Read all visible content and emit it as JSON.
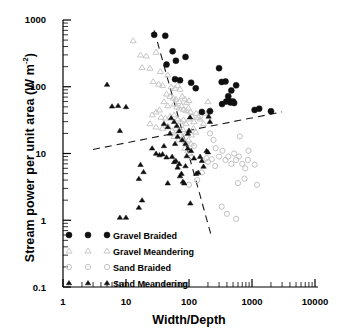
{
  "chart_data": {
    "type": "scatter",
    "title": "",
    "xlabel": "Width/Depth",
    "ylabel_text": "Stream power per unit area (W m",
    "ylabel_sup": "-2",
    "ylabel_tail": ")",
    "ylabel_full": "Stream power per unit area (W m-2)",
    "xscale": "log",
    "yscale": "log",
    "xlim": [
      1,
      10000
    ],
    "ylim": [
      0.1,
      1000
    ],
    "grid": false,
    "legend_position": "bottom-left-inside",
    "xticks": [
      "1",
      "10",
      "100",
      "1000",
      "10000"
    ],
    "xtick_values": [
      1,
      10,
      100,
      1000,
      10000
    ],
    "yticks": [
      "1000",
      "100",
      "10",
      "1",
      "0.1"
    ],
    "ytick_values": [
      1000,
      100,
      10,
      1,
      0.1
    ],
    "legend": [
      {
        "label": "Gravel Braided",
        "marker": "filled-circle",
        "color": "#101010"
      },
      {
        "label": "Gravel Meandering",
        "marker": "open-triangle",
        "color": "#c8c8c8"
      },
      {
        "label": "Sand Braided",
        "marker": "open-circle",
        "color": "#c2c2c2"
      },
      {
        "label": "Sand Meandering",
        "marker": "filled-triangle",
        "color": "#101010"
      }
    ],
    "series": [
      {
        "name": "Gravel Braided",
        "marker": "filled-circle",
        "color": "#101010",
        "points": [
          [
            28,
            600
          ],
          [
            42,
            580
          ],
          [
            55,
            340
          ],
          [
            44,
            215
          ],
          [
            88,
            280
          ],
          [
            62,
            245
          ],
          [
            60,
            130
          ],
          [
            72,
            125
          ],
          [
            108,
            115
          ],
          [
            128,
            95
          ],
          [
            300,
            190
          ],
          [
            330,
            118
          ],
          [
            380,
            120
          ],
          [
            560,
            105
          ],
          [
            470,
            88
          ],
          [
            420,
            72
          ],
          [
            390,
            60
          ],
          [
            430,
            62
          ],
          [
            455,
            58
          ],
          [
            500,
            60
          ],
          [
            520,
            57
          ],
          [
            335,
            55
          ],
          [
            215,
            43
          ],
          [
            1100,
            45
          ],
          [
            1300,
            47
          ],
          [
            2000,
            43
          ],
          [
            160,
            42
          ]
        ]
      },
      {
        "name": "Gravel Meandering",
        "marker": "open-triangle",
        "color": "#c8c8c8",
        "points": [
          [
            13,
            490
          ],
          [
            17,
            300
          ],
          [
            21,
            290
          ],
          [
            18,
            195
          ],
          [
            24,
            190
          ],
          [
            30,
            330
          ],
          [
            35,
            170
          ],
          [
            27,
            120
          ],
          [
            33,
            110
          ],
          [
            38,
            105
          ],
          [
            46,
            150
          ],
          [
            52,
            100
          ],
          [
            60,
            95
          ],
          [
            66,
            105
          ],
          [
            72,
            92
          ],
          [
            44,
            78
          ],
          [
            50,
            72
          ],
          [
            56,
            68
          ],
          [
            62,
            65
          ],
          [
            70,
            60
          ],
          [
            78,
            72
          ],
          [
            86,
            66
          ],
          [
            92,
            58
          ],
          [
            100,
            62
          ],
          [
            58,
            55
          ],
          [
            64,
            50
          ],
          [
            70,
            48
          ],
          [
            76,
            52
          ],
          [
            82,
            46
          ],
          [
            90,
            44
          ],
          [
            98,
            48
          ],
          [
            106,
            42
          ],
          [
            40,
            60
          ],
          [
            46,
            52
          ],
          [
            34,
            45
          ],
          [
            30,
            42
          ],
          [
            26,
            38
          ],
          [
            36,
            35
          ],
          [
            42,
            34
          ],
          [
            50,
            36
          ],
          [
            58,
            38
          ],
          [
            66,
            33
          ],
          [
            74,
            30
          ],
          [
            82,
            32
          ],
          [
            90,
            28
          ],
          [
            100,
            33
          ],
          [
            112,
            36
          ],
          [
            120,
            30
          ],
          [
            130,
            40
          ],
          [
            140,
            35
          ],
          [
            150,
            33
          ],
          [
            170,
            28
          ],
          [
            190,
            40
          ],
          [
            205,
            42
          ],
          [
            24,
            28
          ],
          [
            30,
            25
          ],
          [
            38,
            24
          ],
          [
            46,
            26
          ],
          [
            54,
            22
          ],
          [
            62,
            24
          ],
          [
            70,
            21
          ],
          [
            80,
            23
          ],
          [
            90,
            20
          ],
          [
            100,
            22
          ],
          [
            110,
            19
          ],
          [
            118,
            24
          ],
          [
            128,
            21
          ],
          [
            58,
            18
          ],
          [
            68,
            16
          ],
          [
            78,
            17
          ],
          [
            88,
            15
          ],
          [
            98,
            16
          ],
          [
            108,
            14
          ],
          [
            86,
            12
          ],
          [
            96,
            11
          ],
          [
            104,
            10
          ],
          [
            200,
            60
          ],
          [
            220,
            45
          ]
        ]
      },
      {
        "name": "Sand Braided",
        "marker": "open-circle",
        "color": "#c2c2c2",
        "points": [
          [
            215,
            20
          ],
          [
            245,
            16
          ],
          [
            265,
            12
          ],
          [
            300,
            9
          ],
          [
            340,
            11
          ],
          [
            380,
            8
          ],
          [
            420,
            9
          ],
          [
            470,
            7
          ],
          [
            520,
            10
          ],
          [
            560,
            8
          ],
          [
            620,
            9
          ],
          [
            700,
            7
          ],
          [
            780,
            6
          ],
          [
            860,
            8
          ],
          [
            640,
            18
          ],
          [
            880,
            11
          ],
          [
            1100,
            6.8
          ],
          [
            1200,
            3.4
          ],
          [
            760,
            4.2
          ],
          [
            600,
            3.6
          ],
          [
            330,
            1.6
          ],
          [
            400,
            1.25
          ],
          [
            560,
            1.05
          ],
          [
            200,
            7.5
          ],
          [
            190,
            8.5
          ],
          [
            230,
            8.2
          ],
          [
            260,
            6.5
          ],
          [
            150,
            36
          ],
          [
            135,
            4.0
          ],
          [
            100,
            3.4
          ],
          [
            160,
            5.2
          ],
          [
            120,
            13
          ],
          [
            110,
            8.8
          ]
        ]
      },
      {
        "name": "Sand Meandering",
        "marker": "filled-triangle",
        "color": "#101010",
        "points": [
          [
            5,
            108
          ],
          [
            6,
            51
          ],
          [
            7.5,
            52
          ],
          [
            10,
            50
          ],
          [
            8,
            22
          ],
          [
            8,
            1.1
          ],
          [
            10,
            1.1
          ],
          [
            16,
            1.55
          ],
          [
            18,
            2.0
          ],
          [
            16,
            4.2
          ],
          [
            17,
            6.8
          ],
          [
            19,
            5.3
          ],
          [
            26,
            12
          ],
          [
            30,
            10
          ],
          [
            34,
            9.5
          ],
          [
            38,
            9.8
          ],
          [
            40,
            13
          ],
          [
            44,
            8.8
          ],
          [
            46,
            3.6
          ],
          [
            50,
            20
          ],
          [
            54,
            9.0
          ],
          [
            58,
            7.5
          ],
          [
            62,
            7.8
          ],
          [
            66,
            6.2
          ],
          [
            70,
            7.0
          ],
          [
            72,
            4.6
          ],
          [
            76,
            5.0
          ],
          [
            80,
            3.8
          ],
          [
            84,
            3.6
          ],
          [
            88,
            6.5
          ],
          [
            92,
            9.2
          ],
          [
            96,
            20
          ],
          [
            100,
            22
          ],
          [
            104,
            35
          ],
          [
            108,
            11
          ],
          [
            70,
            22
          ],
          [
            64,
            26
          ],
          [
            58,
            30
          ],
          [
            52,
            34
          ],
          [
            120,
            8.5
          ],
          [
            130,
            5.0
          ],
          [
            140,
            5.2
          ],
          [
            150,
            9.0
          ],
          [
            160,
            7.8
          ],
          [
            170,
            6.4
          ],
          [
            190,
            11
          ],
          [
            200,
            10.5
          ],
          [
            105,
            1.8
          ],
          [
            88,
            14
          ],
          [
            96,
            12
          ],
          [
            78,
            16
          ],
          [
            66,
            18
          ],
          [
            60,
            14
          ],
          [
            46,
            25
          ],
          [
            40,
            28
          ],
          [
            205,
            36
          ],
          [
            215,
            30
          ]
        ]
      }
    ],
    "trend_lines": [
      {
        "name": "shallow-rising-dashed",
        "style": "dashed",
        "x_start": 3.0,
        "y_start": 11.5,
        "x_end": 3000,
        "y_end": 42
      },
      {
        "name": "steep-falling-dashed",
        "style": "dashed",
        "x_start": 28,
        "y_start": 700,
        "x_end": 230,
        "y_end": 0.55
      }
    ]
  }
}
